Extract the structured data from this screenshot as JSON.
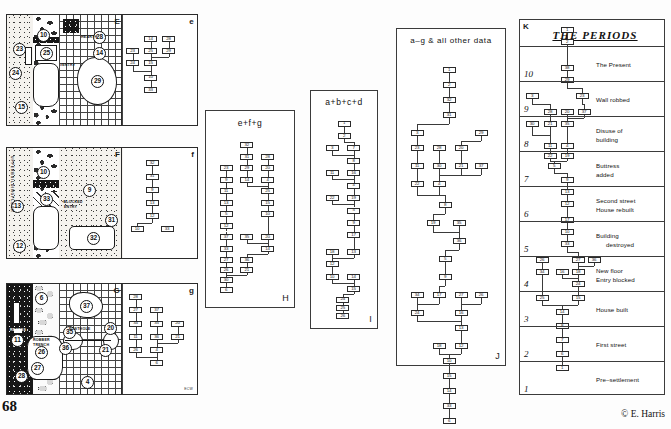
{
  "document": {
    "page_number": "68",
    "copyright": "© E. Harris"
  },
  "plans": [
    {
      "id": "E",
      "letter": "E",
      "matrix_letter": "e",
      "notes": [
        {
          "text": "HEARTH",
          "x": 56,
          "y": 19
        },
        {
          "text": "#ENTRY",
          "x": 45,
          "y": 48
        }
      ],
      "contexts": [
        "23",
        "24",
        "15",
        "10",
        "25",
        "29",
        "14",
        "29b"
      ]
    },
    {
      "id": "F",
      "letter": "F",
      "matrix_letter": "f",
      "notes": [
        {
          "text": "•BLOCKED",
          "x": 45,
          "y": 52
        },
        {
          "text": "ENTRY",
          "x": 47,
          "y": 56
        }
      ],
      "contexts": [
        "13",
        "12",
        "10",
        "33",
        "9",
        "31",
        "32"
      ],
      "side_label": "U P P E R   B U I L D I N G   F L O O R"
    },
    {
      "id": "G",
      "letter": "G",
      "matrix_letter": "g",
      "notes": [
        {
          "text": "POSTHOLE",
          "x": 52,
          "y": 42
        },
        {
          "text": "ROBBER",
          "x": 26,
          "y": 55
        },
        {
          "text": "TRENCH",
          "x": 26,
          "y": 59
        },
        {
          "text": "RECESS",
          "x": 5,
          "y": 49
        }
      ],
      "contexts": [
        "11",
        "6",
        "37",
        "35",
        "36",
        "26",
        "27",
        "28",
        "20",
        "21",
        "4"
      ],
      "credit_mark": "ECW"
    }
  ],
  "matrix_panels": [
    {
      "id": "e",
      "letter": "e",
      "title": ""
    },
    {
      "id": "f",
      "letter": "f",
      "title": ""
    },
    {
      "id": "g",
      "letter": "g",
      "title": "",
      "credit_mark": "ECW"
    },
    {
      "id": "H",
      "letter": "H",
      "title": "e+f+g"
    },
    {
      "id": "I",
      "letter": "I",
      "title": "a+b+c+d"
    },
    {
      "id": "J",
      "letter": "J",
      "title": "a–g & all other data"
    }
  ],
  "periods_panel": {
    "letter": "K",
    "title": "THE  PERIODS",
    "rows": [
      {
        "number": "10",
        "event": "The  Present"
      },
      {
        "number": "9",
        "event": "Wall  robbed"
      },
      {
        "number": "8",
        "event": "Disuse of\nbuilding"
      },
      {
        "number": "7",
        "event": "Buttress\nadded"
      },
      {
        "number": "6",
        "event": "Second  street\nHouse  rebuilt"
      },
      {
        "number": "5",
        "event": "Building\n      destroyed"
      },
      {
        "number": "4",
        "event": "New  floor\nEntry  blocked"
      },
      {
        "number": "3",
        "event": "House  built"
      },
      {
        "number": "2",
        "event": "First  street"
      },
      {
        "number": "1",
        "event": "Pre–settlement"
      }
    ]
  },
  "matrix_e": {
    "nodes": [
      {
        "id": "n1",
        "label": "14",
        "x": 38,
        "y": 22
      },
      {
        "id": "n2",
        "label": "28",
        "x": 62,
        "y": 22
      },
      {
        "id": "n3",
        "label": "23",
        "x": 14,
        "y": 33
      },
      {
        "id": "n4",
        "label": "25",
        "x": 38,
        "y": 33
      },
      {
        "id": "n5",
        "label": "29",
        "x": 62,
        "y": 33
      },
      {
        "id": "n6",
        "label": "24",
        "x": 14,
        "y": 44
      },
      {
        "id": "n7",
        "label": "15",
        "x": 38,
        "y": 44
      },
      {
        "id": "n8",
        "label": "10",
        "x": 38,
        "y": 57
      },
      {
        "id": "n9",
        "label": "33",
        "x": 38,
        "y": 68
      }
    ]
  },
  "matrix_f": {
    "nodes": [
      {
        "id": "n1",
        "label": "32",
        "x": 40,
        "y": 14
      },
      {
        "id": "n2",
        "label": "31",
        "x": 40,
        "y": 26
      },
      {
        "id": "n3",
        "label": "9",
        "x": 40,
        "y": 38
      },
      {
        "id": "n4",
        "label": "13",
        "x": 40,
        "y": 50
      },
      {
        "id": "n5",
        "label": "12",
        "x": 40,
        "y": 62
      },
      {
        "id": "n6",
        "label": "10",
        "x": 20,
        "y": 74
      },
      {
        "id": "n7",
        "label": "33",
        "x": 60,
        "y": 74
      }
    ]
  },
  "matrix_g": {
    "nodes": [
      {
        "id": "n1",
        "label": "28",
        "x": 18,
        "y": 12
      },
      {
        "id": "n2",
        "label": "27",
        "x": 18,
        "y": 24
      },
      {
        "id": "n3",
        "label": "37",
        "x": 46,
        "y": 24
      },
      {
        "id": "n4",
        "label": "34",
        "x": 18,
        "y": 36
      },
      {
        "id": "n5",
        "label": "35",
        "x": 46,
        "y": 36
      },
      {
        "id": "n6",
        "label": "20",
        "x": 74,
        "y": 36
      },
      {
        "id": "n7",
        "label": "11",
        "x": 18,
        "y": 48
      },
      {
        "id": "n8",
        "label": "36",
        "x": 46,
        "y": 48
      },
      {
        "id": "n9",
        "label": "21",
        "x": 74,
        "y": 48
      },
      {
        "id": "n10",
        "label": "26",
        "x": 18,
        "y": 60
      },
      {
        "id": "n11",
        "label": "4",
        "x": 46,
        "y": 60
      },
      {
        "id": "n12",
        "label": "6",
        "x": 46,
        "y": 72
      }
    ]
  },
  "matrix_H": {
    "title": "e+f+g",
    "nodes": [
      {
        "id": "h1",
        "label": "32",
        "x": 46,
        "y": 10
      },
      {
        "id": "h2",
        "label": "31",
        "x": 46,
        "y": 17
      },
      {
        "id": "h3",
        "label": "28",
        "x": 72,
        "y": 17
      },
      {
        "id": "h4",
        "label": "23",
        "x": 20,
        "y": 24
      },
      {
        "id": "h5",
        "label": "29",
        "x": 46,
        "y": 24
      },
      {
        "id": "h6",
        "label": "20",
        "x": 72,
        "y": 24
      },
      {
        "id": "h7",
        "label": "9",
        "x": 20,
        "y": 31
      },
      {
        "id": "h8",
        "label": "14",
        "x": 46,
        "y": 31
      },
      {
        "id": "h9",
        "label": "4",
        "x": 72,
        "y": 31
      },
      {
        "id": "h10",
        "label": "11",
        "x": 20,
        "y": 38
      },
      {
        "id": "h11",
        "label": "25",
        "x": 72,
        "y": 38
      },
      {
        "id": "h12",
        "label": "13",
        "x": 20,
        "y": 45
      },
      {
        "id": "h13",
        "label": "15",
        "x": 72,
        "y": 45
      },
      {
        "id": "h14",
        "label": "5",
        "x": 20,
        "y": 52
      },
      {
        "id": "h15",
        "label": "10",
        "x": 72,
        "y": 52
      },
      {
        "id": "h16",
        "label": "12",
        "x": 20,
        "y": 59
      },
      {
        "id": "h17",
        "label": "37",
        "x": 20,
        "y": 66
      },
      {
        "id": "h18",
        "label": "35",
        "x": 46,
        "y": 66
      },
      {
        "id": "h19",
        "label": "20",
        "x": 72,
        "y": 66
      },
      {
        "id": "h20",
        "label": "33",
        "x": 20,
        "y": 73
      },
      {
        "id": "h21",
        "label": "14",
        "x": 72,
        "y": 73
      },
      {
        "id": "h22",
        "label": "27",
        "x": 20,
        "y": 80
      },
      {
        "id": "h23",
        "label": "36",
        "x": 46,
        "y": 80
      },
      {
        "id": "h24",
        "label": "26",
        "x": 20,
        "y": 86
      },
      {
        "id": "h25",
        "label": "21",
        "x": 46,
        "y": 86
      },
      {
        "id": "h26",
        "label": "30",
        "x": 20,
        "y": 92
      },
      {
        "id": "h27",
        "label": "6",
        "x": 20,
        "y": 98
      }
    ]
  },
  "matrix_I": {
    "title": "a+b+c+d",
    "nodes": [
      {
        "id": "i1",
        "label": "1",
        "x": 50,
        "y": 8
      },
      {
        "id": "i2",
        "label": "2",
        "x": 50,
        "y": 14
      },
      {
        "id": "i3",
        "label": "3",
        "x": 30,
        "y": 20
      },
      {
        "id": "i4",
        "label": "7",
        "x": 66,
        "y": 20
      },
      {
        "id": "i5",
        "label": "8",
        "x": 66,
        "y": 26
      },
      {
        "id": "i6",
        "label": "11",
        "x": 30,
        "y": 32
      },
      {
        "id": "i7",
        "label": "16",
        "x": 66,
        "y": 32
      },
      {
        "id": "i8",
        "label": "4",
        "x": 66,
        "y": 38
      },
      {
        "id": "i9",
        "label": "22",
        "x": 30,
        "y": 44
      },
      {
        "id": "i10",
        "label": "19",
        "x": 66,
        "y": 44
      },
      {
        "id": "i11",
        "label": "5",
        "x": 66,
        "y": 50
      },
      {
        "id": "i12",
        "label": "9",
        "x": 66,
        "y": 56
      },
      {
        "id": "i13",
        "label": "17",
        "x": 66,
        "y": 62
      },
      {
        "id": "i14",
        "label": "18",
        "x": 30,
        "y": 70
      },
      {
        "id": "i15",
        "label": "13",
        "x": 66,
        "y": 70
      },
      {
        "id": "i16",
        "label": "12",
        "x": 30,
        "y": 76
      },
      {
        "id": "i17",
        "label": "10",
        "x": 30,
        "y": 82
      },
      {
        "id": "i18",
        "label": "14",
        "x": 66,
        "y": 82
      },
      {
        "id": "i19",
        "label": "15",
        "x": 66,
        "y": 88
      },
      {
        "id": "i20",
        "label": "24",
        "x": 48,
        "y": 93
      },
      {
        "id": "i21",
        "label": "25",
        "x": 48,
        "y": 97
      },
      {
        "id": "i22",
        "label": "26",
        "x": 48,
        "y": 101
      }
    ]
  },
  "matrix_J": {
    "title": "a–g & all other data",
    "nodes": [
      {
        "id": "j1",
        "label": "1",
        "x": 48,
        "y": 7
      },
      {
        "id": "j2",
        "label": "2",
        "x": 48,
        "y": 12
      },
      {
        "id": "j3",
        "label": "32",
        "x": 48,
        "y": 17
      },
      {
        "id": "j4",
        "label": "31",
        "x": 48,
        "y": 22
      },
      {
        "id": "j5",
        "label": "3",
        "x": 16,
        "y": 28
      },
      {
        "id": "j6",
        "label": "29",
        "x": 80,
        "y": 28
      },
      {
        "id": "j7",
        "label": "23",
        "x": 16,
        "y": 33
      },
      {
        "id": "j8",
        "label": "28",
        "x": 38,
        "y": 33
      },
      {
        "id": "j9",
        "label": "20",
        "x": 60,
        "y": 33
      },
      {
        "id": "j10",
        "label": "11",
        "x": 16,
        "y": 39
      },
      {
        "id": "j11",
        "label": "30",
        "x": 38,
        "y": 39
      },
      {
        "id": "j12",
        "label": "21",
        "x": 60,
        "y": 39
      },
      {
        "id": "j13",
        "label": "37",
        "x": 80,
        "y": 39
      },
      {
        "id": "j14",
        "label": "22",
        "x": 16,
        "y": 45
      },
      {
        "id": "j15",
        "label": "4",
        "x": 38,
        "y": 45
      },
      {
        "id": "j16",
        "label": "8",
        "x": 44,
        "y": 52
      },
      {
        "id": "j17",
        "label": "19",
        "x": 32,
        "y": 58
      },
      {
        "id": "j18",
        "label": "35",
        "x": 58,
        "y": 58
      },
      {
        "id": "j19",
        "label": "36",
        "x": 58,
        "y": 64
      },
      {
        "id": "j20",
        "label": "5",
        "x": 44,
        "y": 70
      },
      {
        "id": "j21",
        "label": "9",
        "x": 44,
        "y": 76
      },
      {
        "id": "j22",
        "label": "34",
        "x": 16,
        "y": 82
      },
      {
        "id": "j23",
        "label": "17",
        "x": 38,
        "y": 82
      },
      {
        "id": "j24",
        "label": "27",
        "x": 60,
        "y": 82
      },
      {
        "id": "j25",
        "label": "26",
        "x": 80,
        "y": 82
      },
      {
        "id": "j26",
        "label": "24",
        "x": 16,
        "y": 88
      },
      {
        "id": "j27",
        "label": "16",
        "x": 60,
        "y": 88
      },
      {
        "id": "j28",
        "label": "13",
        "x": 60,
        "y": 93
      },
      {
        "id": "j29",
        "label": "18",
        "x": 38,
        "y": 99
      },
      {
        "id": "j30",
        "label": "12",
        "x": 60,
        "y": 99
      },
      {
        "id": "j31",
        "label": "10",
        "x": 48,
        "y": 104
      },
      {
        "id": "j32",
        "label": "15",
        "x": 48,
        "y": 109
      },
      {
        "id": "j33",
        "label": "14",
        "x": 48,
        "y": 114
      },
      {
        "id": "j34",
        "label": "33",
        "x": 48,
        "y": 119
      },
      {
        "id": "j35",
        "label": "6",
        "x": 48,
        "y": 124
      }
    ]
  },
  "matrix_K": {
    "nodes": [
      {
        "id": "k1",
        "label": "1",
        "x": 47,
        "y": 10
      },
      {
        "id": "k2",
        "label": "2",
        "x": 47,
        "y": 22
      },
      {
        "id": "k3",
        "label": "38",
        "x": 47,
        "y": 48
      },
      {
        "id": "k4",
        "label": "29",
        "x": 47,
        "y": 60
      },
      {
        "id": "k5",
        "label": "3",
        "x": 12,
        "y": 76
      },
      {
        "id": "k6",
        "label": "23",
        "x": 62,
        "y": 76
      },
      {
        "id": "k7",
        "label": "28",
        "x": 30,
        "y": 92
      },
      {
        "id": "k8",
        "label": "20",
        "x": 47,
        "y": 92
      },
      {
        "id": "k9",
        "label": "37",
        "x": 64,
        "y": 92
      },
      {
        "id": "k10",
        "label": "30",
        "x": 12,
        "y": 104
      },
      {
        "id": "k11",
        "label": "21",
        "x": 30,
        "y": 104
      },
      {
        "id": "k12",
        "label": "35",
        "x": 47,
        "y": 104
      },
      {
        "id": "k13",
        "label": "11",
        "x": 30,
        "y": 126
      },
      {
        "id": "k14",
        "label": "4",
        "x": 47,
        "y": 126
      },
      {
        "id": "k15",
        "label": "22",
        "x": 30,
        "y": 136
      },
      {
        "id": "k16",
        "label": "19",
        "x": 47,
        "y": 136
      },
      {
        "id": "k17",
        "label": "5",
        "x": 34,
        "y": 146
      },
      {
        "id": "k18",
        "label": "9",
        "x": 47,
        "y": 160
      },
      {
        "id": "k19",
        "label": "13",
        "x": 47,
        "y": 172
      },
      {
        "id": "k20",
        "label": "12",
        "x": 47,
        "y": 184
      },
      {
        "id": "k21",
        "label": "17",
        "x": 47,
        "y": 200
      },
      {
        "id": "k22",
        "label": "10",
        "x": 47,
        "y": 212
      },
      {
        "id": "k23",
        "label": "33",
        "x": 47,
        "y": 224
      },
      {
        "id": "k24",
        "label": "26",
        "x": 22,
        "y": 240
      },
      {
        "id": "k25",
        "label": "27",
        "x": 58,
        "y": 240
      },
      {
        "id": "k26",
        "label": "36",
        "x": 74,
        "y": 240
      },
      {
        "id": "k27",
        "label": "34",
        "x": 22,
        "y": 252
      },
      {
        "id": "k28",
        "label": "16",
        "x": 42,
        "y": 252
      },
      {
        "id": "k29",
        "label": "18",
        "x": 58,
        "y": 252
      },
      {
        "id": "k30",
        "label": "24",
        "x": 58,
        "y": 264
      },
      {
        "id": "k31",
        "label": "25",
        "x": 22,
        "y": 278
      },
      {
        "id": "k32",
        "label": "15",
        "x": 58,
        "y": 278
      },
      {
        "id": "k33",
        "label": "14",
        "x": 42,
        "y": 292
      },
      {
        "id": "k34",
        "label": "8",
        "x": 42,
        "y": 306
      },
      {
        "id": "k35",
        "label": "7",
        "x": 42,
        "y": 320
      },
      {
        "id": "k36",
        "label": "6",
        "x": 42,
        "y": 334
      },
      {
        "id": "k37",
        "label": "1",
        "x": 42,
        "y": 348
      }
    ]
  }
}
